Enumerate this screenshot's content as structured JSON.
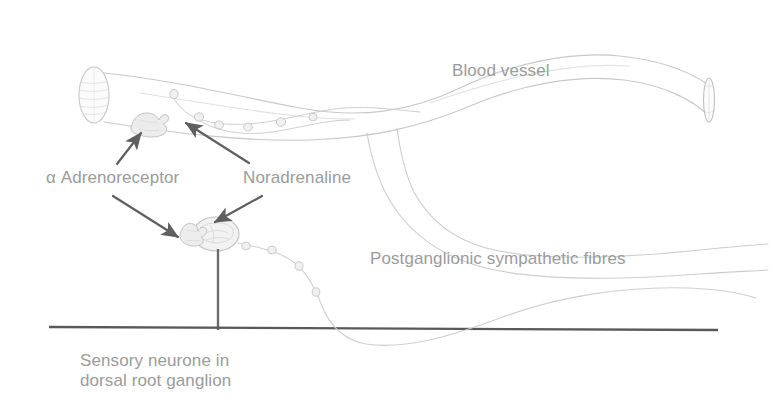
{
  "figure": {
    "background_color": "#ffffff",
    "ink_color": "#9b9b9b",
    "arrow_color": "#5a5a5a",
    "baseline_color": "#4a4a4a",
    "width": 774,
    "height": 416
  },
  "labels": {
    "blood_vessel": "Blood vessel",
    "alpha_adrenoreceptor": "α Adrenoreceptor",
    "noradrenaline": "Noradrenaline",
    "postganglionic": "Postganglionic sympathetic fibres",
    "sensory_neurone": "Sensory neurone in\ndorsal root ganglion"
  },
  "structures": {
    "blood_vessel_label": "blood-vessel-tube",
    "vessel_left_opening_label": "vessel-left-cross-section",
    "vessel_right_opening_label": "vessel-right-cross-section",
    "vessel_wall_receptor_label": "alpha-adrenoreceptor-on-vessel",
    "sensory_terminal_label": "sensory-neurone-terminal-bulb",
    "sensory_terminal_receptor_label": "alpha-adrenoreceptor-on-neurone",
    "axon_stalk_label": "sensory-axon-stalk",
    "dorsal_root_baseline_label": "dorsal-root-ganglion-baseline",
    "sympathetic_fibre_upper_label": "postganglionic-fibre-upper",
    "sympathetic_fibre_lower_label": "postganglionic-fibre-lower",
    "varicosity_label": "noradrenaline-varicosity"
  },
  "arrows": [
    {
      "name": "arrow-alpha-to-vessel-receptor",
      "from": "alpha_adrenoreceptor",
      "to": "vessel_wall_receptor"
    },
    {
      "name": "arrow-alpha-to-neurone-receptor",
      "from": "alpha_adrenoreceptor",
      "to": "sensory_terminal_receptor"
    },
    {
      "name": "arrow-noradrenaline-to-vessel-varicosity",
      "from": "noradrenaline",
      "to": "vessel_varicosity"
    },
    {
      "name": "arrow-noradrenaline-to-neurone-varicosity",
      "from": "noradrenaline",
      "to": "neurone_varicosity"
    }
  ]
}
